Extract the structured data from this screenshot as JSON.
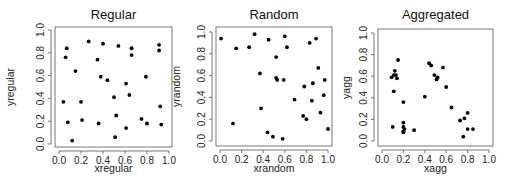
{
  "figure": {
    "width": 523,
    "height": 183
  },
  "chart_data": [
    {
      "type": "scatter",
      "title": "Regular",
      "xlabel": "xregular",
      "ylabel": "yregular",
      "xlim": [
        0,
        1
      ],
      "ylim": [
        0,
        1
      ],
      "xticks": [
        "0.0",
        "0.2",
        "0.4",
        "0.6",
        "0.8",
        "1.0"
      ],
      "yticks": [
        "0.0",
        "0.2",
        "0.4",
        "0.6",
        "0.8",
        "1.0"
      ],
      "grid": false,
      "points": [
        [
          0.07,
          0.84
        ],
        [
          0.06,
          0.76
        ],
        [
          0.27,
          0.9
        ],
        [
          0.4,
          0.88
        ],
        [
          0.54,
          0.86
        ],
        [
          0.66,
          0.84
        ],
        [
          0.66,
          0.78
        ],
        [
          0.91,
          0.87
        ],
        [
          0.91,
          0.82
        ],
        [
          0.15,
          0.64
        ],
        [
          0.35,
          0.74
        ],
        [
          0.38,
          0.59
        ],
        [
          0.44,
          0.56
        ],
        [
          0.61,
          0.53
        ],
        [
          0.79,
          0.59
        ],
        [
          0.64,
          0.43
        ],
        [
          0.5,
          0.41
        ],
        [
          0.04,
          0.37
        ],
        [
          0.2,
          0.37
        ],
        [
          0.92,
          0.33
        ],
        [
          0.52,
          0.25
        ],
        [
          0.21,
          0.21
        ],
        [
          0.75,
          0.22
        ],
        [
          0.08,
          0.19
        ],
        [
          0.36,
          0.18
        ],
        [
          0.8,
          0.18
        ],
        [
          0.93,
          0.17
        ],
        [
          0.61,
          0.14
        ],
        [
          0.51,
          0.06
        ],
        [
          0.12,
          0.03
        ]
      ]
    },
    {
      "type": "scatter",
      "title": "Random",
      "xlabel": "xrandom",
      "ylabel": "yrandom",
      "xlim": [
        0,
        1
      ],
      "ylim": [
        0,
        1
      ],
      "xticks": [
        "0.0",
        "0.2",
        "0.4",
        "0.6",
        "0.8",
        "1.0"
      ],
      "yticks": [
        "0.0",
        "0.2",
        "0.4",
        "0.6",
        "0.8",
        "1.0"
      ],
      "grid": false,
      "points": [
        [
          0.01,
          0.94
        ],
        [
          0.15,
          0.85
        ],
        [
          0.27,
          0.86
        ],
        [
          0.32,
          0.98
        ],
        [
          0.45,
          0.93
        ],
        [
          0.6,
          0.96
        ],
        [
          0.62,
          0.86
        ],
        [
          0.52,
          0.77
        ],
        [
          0.83,
          0.9
        ],
        [
          0.89,
          0.94
        ],
        [
          0.91,
          0.67
        ],
        [
          0.37,
          0.62
        ],
        [
          0.52,
          0.58
        ],
        [
          0.53,
          0.56
        ],
        [
          0.59,
          0.56
        ],
        [
          0.78,
          0.5
        ],
        [
          0.86,
          0.53
        ],
        [
          0.97,
          0.56
        ],
        [
          0.69,
          0.38
        ],
        [
          0.85,
          0.37
        ],
        [
          0.96,
          0.42
        ],
        [
          0.38,
          0.3
        ],
        [
          0.77,
          0.23
        ],
        [
          0.8,
          0.2
        ],
        [
          0.93,
          0.26
        ],
        [
          0.12,
          0.16
        ],
        [
          0.44,
          0.08
        ],
        [
          0.49,
          0.04
        ],
        [
          0.58,
          0.02
        ],
        [
          1.0,
          0.11
        ]
      ]
    },
    {
      "type": "scatter",
      "title": "Aggregated",
      "xlabel": "xagg",
      "ylabel": "yagg",
      "xlim": [
        0,
        1
      ],
      "ylim": [
        0,
        1
      ],
      "xticks": [
        "0.0",
        "0.2",
        "0.4",
        "0.6",
        "0.8",
        "1.0"
      ],
      "yticks": [
        "0.0",
        "0.2",
        "0.4",
        "0.6",
        "0.8",
        "1.0"
      ],
      "grid": false,
      "points": [
        [
          0.15,
          0.75
        ],
        [
          0.09,
          0.59
        ],
        [
          0.12,
          0.65
        ],
        [
          0.11,
          0.61
        ],
        [
          0.13,
          0.61
        ],
        [
          0.14,
          0.58
        ],
        [
          0.11,
          0.46
        ],
        [
          0.2,
          0.36
        ],
        [
          0.2,
          0.17
        ],
        [
          0.2,
          0.13
        ],
        [
          0.21,
          0.11
        ],
        [
          0.2,
          0.09
        ],
        [
          0.2,
          0.08
        ],
        [
          0.3,
          0.1
        ],
        [
          0.1,
          0.13
        ],
        [
          0.44,
          0.72
        ],
        [
          0.46,
          0.7
        ],
        [
          0.57,
          0.68
        ],
        [
          0.49,
          0.61
        ],
        [
          0.52,
          0.59
        ],
        [
          0.51,
          0.57
        ],
        [
          0.6,
          0.5
        ],
        [
          0.4,
          0.41
        ],
        [
          0.65,
          0.31
        ],
        [
          0.73,
          0.19
        ],
        [
          0.77,
          0.21
        ],
        [
          0.8,
          0.26
        ],
        [
          0.8,
          0.11
        ],
        [
          0.85,
          0.11
        ],
        [
          0.76,
          0.04
        ]
      ]
    }
  ],
  "panels": [
    {
      "title": "Regular",
      "xlabel": "xregular",
      "ylabel": "yregular"
    },
    {
      "title": "Random",
      "xlabel": "xrandom",
      "ylabel": "yrandom"
    },
    {
      "title": "Aggregated",
      "xlabel": "xagg",
      "ylabel": "yagg"
    }
  ]
}
